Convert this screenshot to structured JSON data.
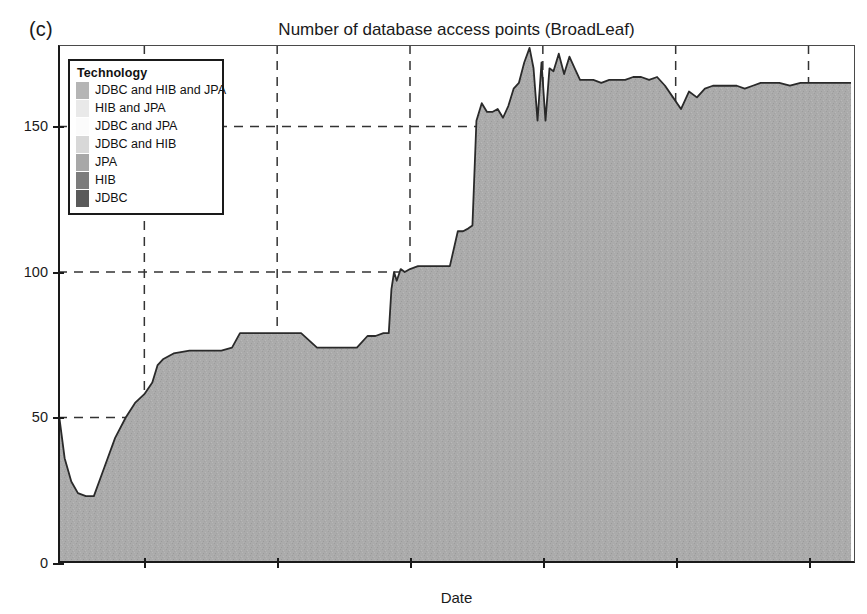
{
  "panel_label": "(c)",
  "axis": {
    "y_ticks": [
      0,
      50,
      100,
      150
    ],
    "x_ticks": [
      "2010",
      "2011",
      "2012",
      "2013",
      "2014",
      "2015"
    ]
  },
  "legend": {
    "title": "Technology",
    "items": [
      {
        "label": "JDBC and HIB and JPA",
        "color": "#b5b5b5"
      },
      {
        "label": "HIB and JPA",
        "color": "#e9e9e9"
      },
      {
        "label": "JDBC and JPA",
        "color": "#fbfbfb"
      },
      {
        "label": "JDBC and HIB",
        "color": "#d8d8d8"
      },
      {
        "label": "JPA",
        "color": "#a8a8a8"
      },
      {
        "label": "HIB",
        "color": "#7c7c7c"
      },
      {
        "label": "JDBC",
        "color": "#5a5a5a"
      }
    ]
  },
  "chart_data": {
    "type": "area",
    "title": "Number of database access points (BroadLeaf)",
    "xlabel": "Date",
    "ylabel": "Accesses",
    "ylim": [
      0,
      178
    ],
    "xlim": [
      2009.35,
      2015.35
    ],
    "grid": true,
    "legend_position": "upper-left",
    "fill_color": "#a9a9a9",
    "line_color": "#2a2a2a",
    "series_name": "JPA",
    "x": [
      2009.36,
      2009.4,
      2009.45,
      2009.5,
      2009.56,
      2009.62,
      2009.7,
      2009.78,
      2009.86,
      2009.93,
      2010.0,
      2010.06,
      2010.1,
      2010.14,
      2010.22,
      2010.34,
      2010.46,
      2010.58,
      2010.66,
      2010.72,
      2010.82,
      2010.94,
      2011.06,
      2011.18,
      2011.3,
      2011.42,
      2011.52,
      2011.6,
      2011.68,
      2011.74,
      2011.8,
      2011.84,
      2011.86,
      2011.88,
      2011.9,
      2011.93,
      2011.96,
      2012.0,
      2012.06,
      2012.14,
      2012.22,
      2012.3,
      2012.36,
      2012.4,
      2012.44,
      2012.47,
      2012.5,
      2012.54,
      2012.58,
      2012.62,
      2012.66,
      2012.7,
      2012.74,
      2012.78,
      2012.82,
      2012.86,
      2012.9,
      2012.93,
      2012.96,
      2012.99,
      2013.02,
      2013.05,
      2013.08,
      2013.12,
      2013.16,
      2013.2,
      2013.24,
      2013.28,
      2013.32,
      2013.38,
      2013.44,
      2013.5,
      2013.56,
      2013.62,
      2013.68,
      2013.74,
      2013.8,
      2013.86,
      2013.92,
      2013.98,
      2014.04,
      2014.1,
      2014.16,
      2014.22,
      2014.28,
      2014.34,
      2014.4,
      2014.46,
      2014.52,
      2014.58,
      2014.64,
      2014.7,
      2014.78,
      2014.86,
      2014.94,
      2015.02,
      2015.1,
      2015.2,
      2015.32
    ],
    "y": [
      50,
      36,
      28,
      24,
      23,
      23,
      33,
      43,
      50,
      55,
      58,
      62,
      68,
      70,
      72,
      73,
      73,
      73,
      74,
      79,
      79,
      79,
      79,
      79,
      74,
      74,
      74,
      74,
      78,
      78,
      79,
      79,
      94,
      100,
      97,
      101,
      100,
      101,
      102,
      102,
      102,
      102,
      114,
      114,
      115,
      116,
      152,
      158,
      155,
      155,
      156,
      153,
      157,
      163,
      165,
      172,
      177,
      170,
      152,
      172,
      152,
      170,
      169,
      175,
      168,
      174,
      170,
      166,
      166,
      166,
      165,
      166,
      166,
      166,
      167,
      167,
      166,
      167,
      164,
      160,
      156,
      162,
      160,
      163,
      164,
      164,
      164,
      164,
      163,
      164,
      165,
      165,
      165,
      164,
      165,
      165,
      165,
      165,
      165
    ]
  }
}
